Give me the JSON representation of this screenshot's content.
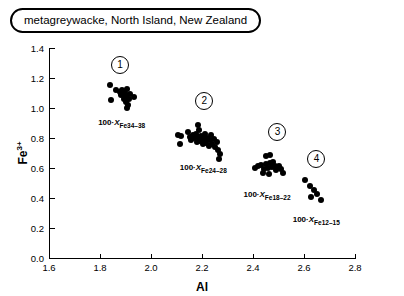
{
  "chart_data": {
    "type": "scatter",
    "title": "metagreywacke, North Island, New Zealand",
    "xlabel": "Al",
    "ylabel": "Fe3+",
    "ylabel_base": "Fe",
    "ylabel_sup": "3+",
    "xlim": [
      1.6,
      2.8
    ],
    "ylim": [
      0.0,
      1.4
    ],
    "xticks": [
      "1.6",
      "1.8",
      "2.0",
      "2.2",
      "2.4",
      "2.6",
      "2.8"
    ],
    "xtick_values": [
      1.6,
      1.8,
      2.0,
      2.2,
      2.4,
      2.6,
      2.8
    ],
    "yticks": [
      "0.0",
      "0.2",
      "0.4",
      "0.6",
      "0.8",
      "1.0",
      "1.2",
      "1.4"
    ],
    "ytick_values": [
      0.0,
      0.2,
      0.4,
      0.6,
      0.8,
      1.0,
      1.2,
      1.4
    ],
    "grid": false,
    "legend": "none",
    "marker": "filled-circle",
    "marker_color": "#000000",
    "clusters": [
      {
        "id": "1",
        "number_label": "1",
        "label_prefix": "100·",
        "label_italic": "X",
        "label_sub_fe": "Fe",
        "label_range": "34–38",
        "number_at": {
          "x": 1.875,
          "y": 1.295
        },
        "label_at": {
          "x": 1.885,
          "y": 0.935
        },
        "points": [
          {
            "x": 1.838,
            "y": 1.152
          },
          {
            "x": 1.862,
            "y": 1.118
          },
          {
            "x": 1.845,
            "y": 1.052
          },
          {
            "x": 1.878,
            "y": 1.105
          },
          {
            "x": 1.884,
            "y": 1.086
          },
          {
            "x": 1.888,
            "y": 1.122
          },
          {
            "x": 1.893,
            "y": 1.062
          },
          {
            "x": 1.897,
            "y": 1.098
          },
          {
            "x": 1.9,
            "y": 1.04
          },
          {
            "x": 1.903,
            "y": 1.078
          },
          {
            "x": 1.906,
            "y": 1.128
          },
          {
            "x": 1.91,
            "y": 1.02
          },
          {
            "x": 1.913,
            "y": 1.058
          },
          {
            "x": 1.917,
            "y": 1.092
          },
          {
            "x": 1.905,
            "y": 1.002
          },
          {
            "x": 1.935,
            "y": 1.072
          }
        ]
      },
      {
        "id": "2",
        "number_label": "2",
        "label_prefix": "100·",
        "label_italic": "X",
        "label_sub_fe": "Fe",
        "label_range": "24–28",
        "number_at": {
          "x": 2.205,
          "y": 1.055
        },
        "label_at": {
          "x": 2.205,
          "y": 0.635
        },
        "points": [
          {
            "x": 2.105,
            "y": 0.818
          },
          {
            "x": 2.118,
            "y": 0.812
          },
          {
            "x": 2.112,
            "y": 0.762
          },
          {
            "x": 2.145,
            "y": 0.838
          },
          {
            "x": 2.152,
            "y": 0.808
          },
          {
            "x": 2.158,
            "y": 0.788
          },
          {
            "x": 2.164,
            "y": 0.822
          },
          {
            "x": 2.17,
            "y": 0.798
          },
          {
            "x": 2.176,
            "y": 0.828
          },
          {
            "x": 2.181,
            "y": 0.775
          },
          {
            "x": 2.186,
            "y": 0.805
          },
          {
            "x": 2.19,
            "y": 0.852
          },
          {
            "x": 2.194,
            "y": 0.782
          },
          {
            "x": 2.198,
            "y": 0.812
          },
          {
            "x": 2.202,
            "y": 0.758
          },
          {
            "x": 2.207,
            "y": 0.796
          },
          {
            "x": 2.212,
            "y": 0.828
          },
          {
            "x": 2.216,
            "y": 0.77
          },
          {
            "x": 2.221,
            "y": 0.802
          },
          {
            "x": 2.226,
            "y": 0.748
          },
          {
            "x": 2.231,
            "y": 0.786
          },
          {
            "x": 2.236,
            "y": 0.818
          },
          {
            "x": 2.241,
            "y": 0.762
          },
          {
            "x": 2.246,
            "y": 0.792
          },
          {
            "x": 2.252,
            "y": 0.742
          },
          {
            "x": 2.258,
            "y": 0.772
          },
          {
            "x": 2.264,
            "y": 0.718
          },
          {
            "x": 2.27,
            "y": 0.692
          },
          {
            "x": 2.266,
            "y": 0.662
          },
          {
            "x": 2.186,
            "y": 0.885
          }
        ]
      },
      {
        "id": "3",
        "number_label": "3",
        "label_prefix": "100·",
        "label_italic": "X",
        "label_sub_fe": "Fe",
        "label_range": "18–22",
        "number_at": {
          "x": 2.492,
          "y": 0.845
        },
        "label_at": {
          "x": 2.455,
          "y": 0.455
        },
        "points": [
          {
            "x": 2.452,
            "y": 0.682
          },
          {
            "x": 2.468,
            "y": 0.685
          },
          {
            "x": 2.408,
            "y": 0.598
          },
          {
            "x": 2.418,
            "y": 0.612
          },
          {
            "x": 2.432,
            "y": 0.622
          },
          {
            "x": 2.442,
            "y": 0.595
          },
          {
            "x": 2.452,
            "y": 0.628
          },
          {
            "x": 2.46,
            "y": 0.602
          },
          {
            "x": 2.468,
            "y": 0.632
          },
          {
            "x": 2.474,
            "y": 0.608
          },
          {
            "x": 2.48,
            "y": 0.638
          },
          {
            "x": 2.486,
            "y": 0.612
          },
          {
            "x": 2.492,
            "y": 0.585
          },
          {
            "x": 2.5,
            "y": 0.615
          },
          {
            "x": 2.508,
            "y": 0.592
          },
          {
            "x": 2.516,
            "y": 0.565
          },
          {
            "x": 2.438,
            "y": 0.568
          },
          {
            "x": 2.462,
            "y": 0.558
          }
        ]
      },
      {
        "id": "4",
        "number_label": "4",
        "label_prefix": "100·",
        "label_italic": "X",
        "label_sub_fe": "Fe",
        "label_range": "12–15",
        "number_at": {
          "x": 2.645,
          "y": 0.665
        },
        "label_at": {
          "x": 2.648,
          "y": 0.285
        },
        "points": [
          {
            "x": 2.602,
            "y": 0.522
          },
          {
            "x": 2.622,
            "y": 0.478
          },
          {
            "x": 2.638,
            "y": 0.455
          },
          {
            "x": 2.628,
            "y": 0.408
          },
          {
            "x": 2.652,
            "y": 0.428
          },
          {
            "x": 2.668,
            "y": 0.385
          }
        ]
      }
    ]
  }
}
